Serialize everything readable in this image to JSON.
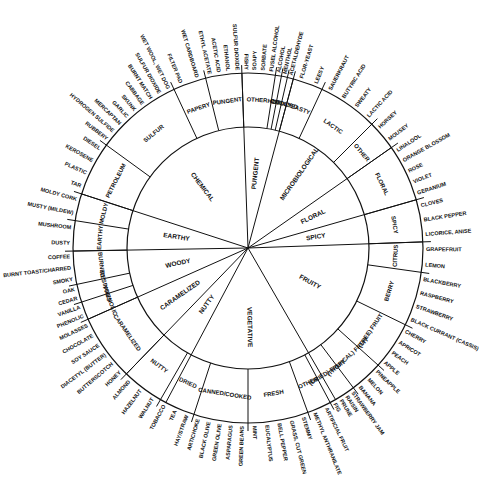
{
  "geometry": {
    "cx": 248,
    "cy": 248,
    "r_mid": 121,
    "r_outer": 175
  },
  "colors": {
    "ink": "#111111",
    "background": "#ffffff"
  },
  "categories": [
    {
      "label": "CHEMICAL",
      "start": -72,
      "end": -2,
      "subs": [
        {
          "label": "PETROLEUM",
          "start": -72,
          "end": -54,
          "items": [
            "TAR",
            "PLASTIC",
            "KEROSENE",
            "DIESEL"
          ]
        },
        {
          "label": "SULFUR",
          "start": -54,
          "end": -25,
          "items": [
            "RUBBERY",
            "HYDROGEN SULFIDE",
            "MERCAPTAN",
            "GARLIC",
            "SKUNK",
            "CABBAGE",
            "BURNT MATCH",
            "SULFUR DIOXIDE",
            "WET WOOL, WET DOG"
          ]
        },
        {
          "label": "PAPERY",
          "start": -25,
          "end": -14,
          "items": [
            "FILTER PAD",
            "WET CARDBOARD"
          ]
        },
        {
          "label": "PUNGENT",
          "start": -14,
          "end": -2,
          "items": [
            "ETHYL ACETATE",
            "ACETIC ACID",
            "ETHANOL",
            "SULFUR DIOXIDE"
          ]
        }
      ]
    },
    {
      "label": "PUNGENT",
      "start": -2,
      "end": 14,
      "subs": [
        {
          "label": "OTHER",
          "start": -2,
          "end": 9,
          "items": [
            "FISHY",
            "SOAPY",
            "SORBATE",
            "FUSEL ALCOHOL"
          ]
        },
        {
          "label": "HOT",
          "start": 9,
          "end": 11,
          "items": [
            "ALCOHOL"
          ]
        },
        {
          "label": "COOL",
          "start": 11,
          "end": 13,
          "items": [
            "MENTHOL"
          ]
        },
        {
          "label": "OXIDIZED",
          "start": 13,
          "end": 15,
          "items": [
            "ACETALDEHYDE"
          ]
        }
      ]
    },
    {
      "label": "MICROBIOLOGICAL",
      "start": 15,
      "end": 55,
      "subs": [
        {
          "label": "YEASTY",
          "start": 15,
          "end": 25,
          "items": [
            "FLOR-YEAST",
            "LEESY"
          ]
        },
        {
          "label": "LACTIC",
          "start": 25,
          "end": 45,
          "items": [
            "SAUERKRAUT",
            "BUTYRIC ACID",
            "SWEATY",
            "LACTIC ACID"
          ]
        },
        {
          "label": "OTHER",
          "start": 45,
          "end": 55,
          "items": [
            "HORSEY",
            "MOUSEY"
          ]
        }
      ]
    },
    {
      "label": "FLORAL",
      "start": 55,
      "end": 74,
      "subs": [
        {
          "label": "FLORAL",
          "start": 55,
          "end": 74,
          "items": [
            "LINALOOL",
            "ORANGE BLOSSOM",
            "ROSE",
            "VIOLET",
            "GERANIUM"
          ]
        }
      ]
    },
    {
      "label": "SPICY",
      "start": 74,
      "end": 88,
      "subs": [
        {
          "label": "SPICY",
          "start": 74,
          "end": 88,
          "items": [
            "CLOVES",
            "BLACK PEPPER",
            "LICORICE, ANISE"
          ]
        }
      ]
    },
    {
      "label": "FRUITY",
      "start": 88,
      "end": 150,
      "subs": [
        {
          "label": "CITRUS",
          "start": 88,
          "end": 98,
          "items": [
            "GRAPEFRUIT",
            "LEMON"
          ]
        },
        {
          "label": "BERRY",
          "start": 98,
          "end": 116,
          "items": [
            "BLACKBERRY",
            "RASPBERRY",
            "STRAWBERRY",
            "BLACK CURRANT (CASSIS)"
          ]
        },
        {
          "label": "(TREE) FRUIT",
          "start": 116,
          "end": 132,
          "items": [
            "CHERRY",
            "APRICOT",
            "PEACH",
            "APPLE"
          ]
        },
        {
          "label": "(TROPICAL) FRUIT",
          "start": 132,
          "end": 143,
          "items": [
            "PINEAPPLE",
            "MELON",
            "BANANA"
          ]
        },
        {
          "label": "(DRIED) FRUIT",
          "start": 143,
          "end": 152,
          "items": [
            "STRAWBERRY JAM",
            "RAISIN",
            "PRUNE",
            "FIG"
          ]
        },
        {
          "label": "OTHER",
          "start": 152,
          "end": 160,
          "items": [
            "ARTIFICIAL FRUIT",
            "METHYL ANTHRANILATE"
          ]
        }
      ]
    },
    {
      "label": "VEGETATIVE",
      "start": 150,
      "end": 208,
      "subs": [
        {
          "label": "FRESH",
          "start": 160,
          "end": 180,
          "items": [
            "STEMMY",
            "GRASS, CUT GREEN",
            "BELL PEPPER",
            "EUCALYPTUS",
            "MINT"
          ]
        },
        {
          "label": "CANNED/COOKED",
          "start": 180,
          "end": 198,
          "items": [
            "GREEN BEANS",
            "ASPARAGUS",
            "GREEN OLIVE",
            "BLACK OLIVE",
            "ARTICHOKE"
          ]
        },
        {
          "label": "DRIED",
          "start": 198,
          "end": 210,
          "items": [
            "HAY/STRAW",
            "TEA",
            "TOBACCO"
          ]
        }
      ]
    },
    {
      "label": "NUTTY",
      "start": 208,
      "end": 224,
      "subs": [
        {
          "label": "NUTTY",
          "start": 210,
          "end": 224,
          "items": [
            "WALNUT",
            "HAZELNUT",
            "ALMOND"
          ]
        }
      ]
    },
    {
      "label": "CARAMELIZED",
      "start": 224,
      "end": 246,
      "subs": [
        {
          "label": "CARAMELIZED",
          "start": 224,
          "end": 246,
          "items": [
            "HONEY",
            "BUTTERSCOTCH",
            "DIACETYL (BUTTER)",
            "SOY SAUCE",
            "CHOCOLATE",
            "MOLASSES"
          ]
        }
      ]
    },
    {
      "label": "WOODY",
      "start": 246,
      "end": 269,
      "subs": [
        {
          "label": "PHENOLIC",
          "start": 246,
          "end": 252,
          "items": [
            "PHENOLIC",
            "VANILLA"
          ]
        },
        {
          "label": "RESINOUS",
          "start": 252,
          "end": 258,
          "items": [
            "CEDAR",
            "OAK"
          ]
        },
        {
          "label": "BURNED",
          "start": 258,
          "end": 269,
          "items": [
            "SMOKY",
            "BURNT TOAST/CHARRED",
            "COFFEE"
          ]
        }
      ]
    },
    {
      "label": "EARTHY",
      "start": 269,
      "end": 288,
      "subs": [
        {
          "label": "EARTHY",
          "start": 269,
          "end": 279,
          "items": [
            "DUSTY",
            "MUSHROOM"
          ]
        },
        {
          "label": "MOLDY",
          "start": 279,
          "end": 288,
          "items": [
            "MUSTY (MILDEW)",
            "MOLDY CORK"
          ]
        }
      ]
    }
  ]
}
